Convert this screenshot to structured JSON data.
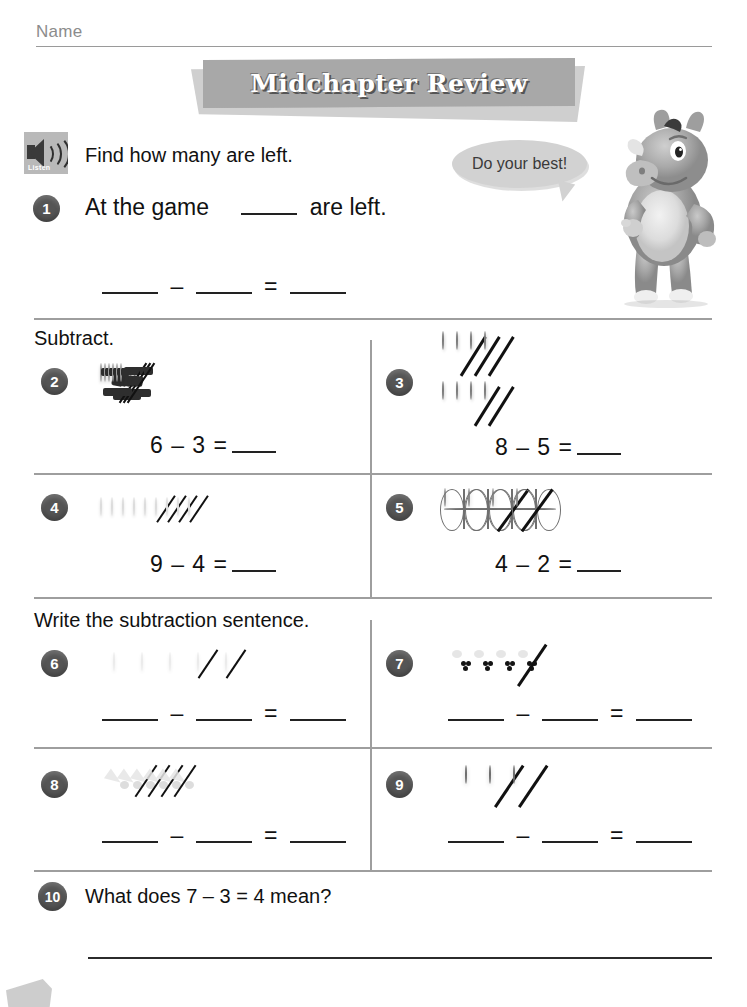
{
  "header": {
    "name_label": "Name",
    "title": "Midchapter Review"
  },
  "mascot": {
    "speech": "Do your best!",
    "icon": "rhino-mascot"
  },
  "listen_icon_label": "Listen",
  "sections": [
    {
      "instruction": "Find how many are left."
    },
    {
      "instruction": "Subtract."
    },
    {
      "instruction": "Write the subtraction sentence."
    }
  ],
  "problems": {
    "p1": {
      "number": "1",
      "text_before": "At the game",
      "text_after": "are left.",
      "equation_blanks": 3,
      "minus": "–",
      "equals": "="
    },
    "p2": {
      "number": "2",
      "object": "soccer-ball",
      "total": 6,
      "crossed": 3,
      "rows": [
        6
      ],
      "equation": "6 – 3 ="
    },
    "p3": {
      "number": "3",
      "object": "football",
      "total": 8,
      "crossed": 5,
      "rows": [
        4,
        4
      ],
      "equation": "8 – 5 ="
    },
    "p4": {
      "number": "4",
      "object": "golf-ball",
      "total": 9,
      "crossed": 4,
      "rows": [
        9
      ],
      "equation": "9 – 4 ="
    },
    "p5": {
      "number": "5",
      "object": "basketball",
      "total": 4,
      "crossed": 2,
      "rows": [
        4
      ],
      "equation": "4 – 2 ="
    },
    "p6": {
      "number": "6",
      "object": "golf-ball",
      "total": 5,
      "crossed": 2,
      "rows": [
        5
      ],
      "equation": ""
    },
    "p7": {
      "number": "7",
      "object": "bowling-ball",
      "total": 4,
      "crossed": 1,
      "rows": [
        4
      ],
      "equation": ""
    },
    "p8": {
      "number": "8",
      "object": "shuttlecock",
      "total": 6,
      "crossed": 4,
      "rows": [
        6
      ],
      "equation": ""
    },
    "p9": {
      "number": "9",
      "object": "tennis-ball",
      "total": 3,
      "crossed": 2,
      "rows": [
        3
      ],
      "equation": ""
    },
    "p10": {
      "number": "10",
      "question": "What does 7 – 3 = 4 mean?"
    }
  },
  "symbols": {
    "minus": "–",
    "equals": "="
  },
  "colors": {
    "banner_front": "#a8a8a8",
    "banner_back": "#cfcfcf",
    "badge": "#555555",
    "rule": "#9e9e9e",
    "name_rule": "#9a9a9a",
    "bubble": "#d2d2d2"
  }
}
